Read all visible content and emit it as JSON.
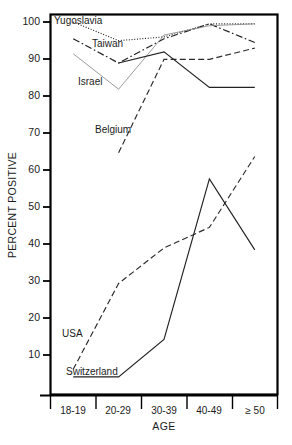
{
  "chart_data": {
    "type": "line",
    "title": "",
    "xlabel": "AGE",
    "ylabel": "PERCENT POSITIVE",
    "categories": [
      "18-19",
      "20-29",
      "30-39",
      "40-49",
      "≥ 50"
    ],
    "ylim": [
      0,
      102
    ],
    "yticks": [
      10,
      20,
      30,
      40,
      50,
      60,
      70,
      80,
      90,
      100
    ],
    "grid": false,
    "legend_position": "inline-labels",
    "series": [
      {
        "name": "Yugoslavia",
        "label": "Yugoslavia",
        "style": "dotted",
        "color": "#222222",
        "values": [
          100,
          95,
          96,
          99.5,
          99.5
        ]
      },
      {
        "name": "Taiwan",
        "label": "Taiwan",
        "style": "dash-dot",
        "color": "#222222",
        "values": [
          95.5,
          89,
          95.5,
          99.5,
          94.5
        ]
      },
      {
        "name": "Israel",
        "label": "Israel",
        "style": "solid-thin",
        "color": "#8a8a8a",
        "values": [
          91.5,
          82,
          96.5,
          99,
          99.5
        ]
      },
      {
        "name": "Belgium",
        "label": "Belgium",
        "style": "dashed",
        "color": "#2a2a2a",
        "values": [
          null,
          65,
          90,
          90,
          93
        ]
      },
      {
        "name": "Israel-lower",
        "label": "",
        "style": "solid",
        "color": "#222222",
        "values": [
          null,
          89,
          92,
          82.5,
          82.5
        ]
      },
      {
        "name": "USA",
        "label": "USA",
        "style": "dashed",
        "color": "#2a2a2a",
        "values": [
          7,
          30,
          39.5,
          45,
          64
        ]
      },
      {
        "name": "Switzerland",
        "label": "Switzerland",
        "style": "solid",
        "color": "#222222",
        "values": [
          5,
          5,
          15,
          58,
          39
        ]
      }
    ],
    "annotations": [
      {
        "text": "Yugoslavia",
        "x": 54,
        "y": 24
      },
      {
        "text": "Taiwan",
        "x": 92,
        "y": 47
      },
      {
        "text": "Israel",
        "x": 78,
        "y": 85
      },
      {
        "text": "Belgium",
        "x": 95,
        "y": 133
      },
      {
        "text": "USA",
        "x": 62,
        "y": 337
      },
      {
        "text": "Switzerland",
        "x": 66,
        "y": 375
      }
    ]
  },
  "caption": {
    "text": ""
  }
}
